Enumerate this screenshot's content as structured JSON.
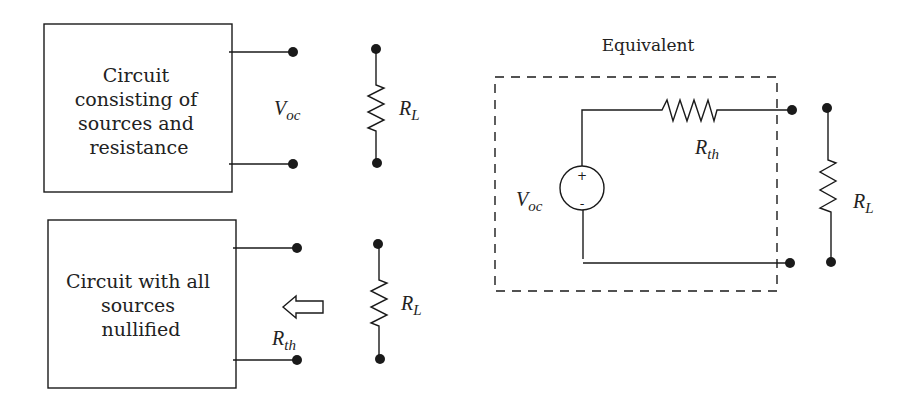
{
  "diagram": {
    "type": "circuit-thevenin-equivalent",
    "panel_top_left": {
      "box_lines": [
        "Circuit",
        "consisting of",
        "sources and",
        "resistance"
      ],
      "terminal_label": {
        "main": "V",
        "sub": "oc"
      },
      "load_label": {
        "main": "R",
        "sub": "L"
      }
    },
    "panel_bottom_left": {
      "box_lines": [
        "Circuit with all",
        "sources",
        "nullified"
      ],
      "arrow": "hollow-left-arrow",
      "terminal_label": {
        "main": "R",
        "sub": "th"
      },
      "load_label": {
        "main": "R",
        "sub": "L"
      }
    },
    "panel_right": {
      "title": "Equivalent",
      "source_label": {
        "main": "V",
        "sub": "oc"
      },
      "source_plus": "+",
      "source_minus": "-",
      "series_label": {
        "main": "R",
        "sub": "th"
      },
      "load_label": {
        "main": "R",
        "sub": "L"
      }
    },
    "colors": {
      "line": "#1a1a1a",
      "background": "#ffffff"
    }
  }
}
